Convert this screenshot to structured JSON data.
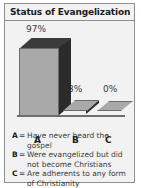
{
  "figure": {
    "title": "Status of Evangelization",
    "border_color": "#8f8f8f",
    "background_color": "#f2f2f2"
  },
  "chart_data": {
    "type": "bar",
    "title": "Status of Evangelization",
    "categories": [
      "A",
      "B",
      "C"
    ],
    "values": [
      97,
      3,
      0
    ],
    "value_labels": [
      "97%",
      "3%",
      "0%"
    ],
    "xlabel": "",
    "ylabel": "",
    "ylim": [
      0,
      100
    ],
    "grid": false,
    "legend_position": "below",
    "style": "3d-bar",
    "series_colors": {
      "front_face": "#a9a9a9",
      "side_face": "#2b2b2b",
      "top_face": "#3b3b3b",
      "outline": "#6b6b6b"
    },
    "legend": [
      {
        "key": "A",
        "separator": "=",
        "description": "Have never heard the gospel"
      },
      {
        "key": "B",
        "separator": "=",
        "description": "Were evangelized but did not become Christians"
      },
      {
        "key": "C",
        "separator": "=",
        "description": "Are adherents to any form of Christianity"
      }
    ]
  }
}
